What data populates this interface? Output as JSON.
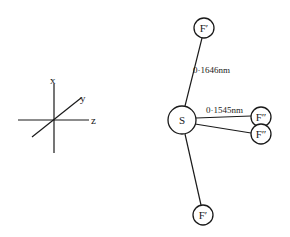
{
  "diagram": {
    "type": "molecular-geometry",
    "central_atom": {
      "label": "S",
      "cx": 182,
      "cy": 120,
      "r": 14
    },
    "atoms": [
      {
        "id": "f-axial-top",
        "label": "F′",
        "cx": 204,
        "cy": 28,
        "r": 10
      },
      {
        "id": "f-equatorial-1",
        "label": "F″",
        "cx": 261,
        "cy": 117,
        "r": 10
      },
      {
        "id": "f-equatorial-2",
        "label": "F″",
        "cx": 261,
        "cy": 134,
        "r": 10
      },
      {
        "id": "f-axial-bottom",
        "label": "F′",
        "cx": 203,
        "cy": 215,
        "r": 10
      }
    ],
    "bond_labels": {
      "axial": "0·1646nm",
      "equatorial": "0·1545nm"
    },
    "axes": {
      "x_label": "x",
      "y_label": "y",
      "z_label": "z"
    },
    "colors": {
      "stroke": "#1a1a1a",
      "background": "#ffffff"
    }
  }
}
